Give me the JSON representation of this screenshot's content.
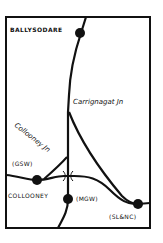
{
  "diagram": {
    "type": "railway-junction-map",
    "colors": {
      "line": "#111111",
      "background": "#ffffff",
      "text": "#111111"
    },
    "stations": [
      {
        "id": "ballysodare",
        "label": "BALLYSODARE"
      },
      {
        "id": "collooney",
        "label": "COLLOONEY"
      },
      {
        "id": "gsw",
        "label": "(GSW)"
      },
      {
        "id": "mgw",
        "label": "(MGW)"
      },
      {
        "id": "slnc",
        "label": "(SL&NC)"
      }
    ],
    "junctions": [
      {
        "id": "carrignagat",
        "label": "Carrignagat Jn"
      },
      {
        "id": "collooney-jn",
        "label": "Collooney Jn"
      }
    ]
  }
}
